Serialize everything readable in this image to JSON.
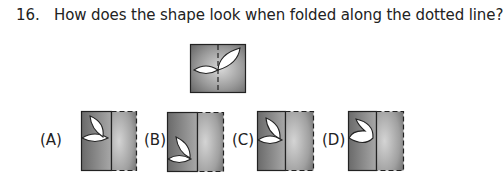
{
  "question": {
    "number": "16.",
    "text": "How does the shape look when folded along the dotted line?"
  },
  "figure": {
    "fill_dark": "#6e6e6e",
    "fill_light": "#cfcfcf"
  },
  "options": [
    {
      "label": "(A)"
    },
    {
      "label": "(B)"
    },
    {
      "label": "(C)"
    },
    {
      "label": "(D)"
    }
  ]
}
